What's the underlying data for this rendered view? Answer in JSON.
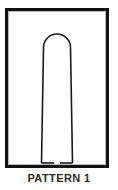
{
  "caption": {
    "label": "PATTERN 1"
  },
  "frame": {
    "border_color": "#121212",
    "background_color": "#ffffff",
    "inner_edge_color": "#b9b9b9"
  },
  "pattern": {
    "name": "tapered-dome-top-open-bottom",
    "stroke_color": "#1a1a1a",
    "fill_color": "#ffffff",
    "outline": "M 33.5 152 L 35.5 36.5 A 13.5 13.5 0 0 1 62.5 36.5 L 64.5 152",
    "bottom_left_segment": "M 33.5 152 L 46 152",
    "bottom_right_segment": "M 52 152 L 64.5 152",
    "notch_gap_present": true
  }
}
